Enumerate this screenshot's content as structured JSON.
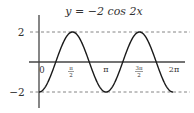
{
  "chart_data": {
    "type": "line",
    "title": "y = −2 cos 2x",
    "xlabel": "",
    "ylabel": "",
    "function": "y = -2*cos(2x)",
    "xlim": [
      0,
      6.2832
    ],
    "ylim": [
      -2,
      2
    ],
    "x_ticks": [
      {
        "value": 0,
        "label": "0"
      },
      {
        "value": 1.5708,
        "label": "π/2"
      },
      {
        "value": 3.1416,
        "label": "π"
      },
      {
        "value": 4.7124,
        "label": "3π/2"
      },
      {
        "value": 6.2832,
        "label": "2π"
      }
    ],
    "y_ticks": [
      {
        "value": 2,
        "label": "2"
      },
      {
        "value": -2,
        "label": "−2"
      }
    ],
    "reference_lines": [
      {
        "y": 2,
        "style": "dashed"
      },
      {
        "y": -2,
        "style": "dashed"
      }
    ],
    "series": [
      {
        "name": "y = −2 cos 2x",
        "x": [
          0,
          0.7854,
          1.5708,
          2.3562,
          3.1416,
          3.927,
          4.7124,
          5.4978,
          6.2832
        ],
        "values": [
          -2,
          0,
          2,
          0,
          -2,
          0,
          2,
          0,
          -2
        ]
      }
    ],
    "grid": false,
    "legend": "none"
  },
  "labels": {
    "title": "y = −2 cos 2x",
    "y_top": "2",
    "y_bottom": "−2",
    "x0": "0",
    "x_pi": "π",
    "x_2pi": "2π",
    "x_half_num": "π",
    "x_half_den": "2",
    "x_3half_num": "3π",
    "x_3half_den": "2"
  },
  "colors": {
    "curve": "#1a1a1a",
    "axis": "#444444",
    "dashed": "#666666"
  }
}
